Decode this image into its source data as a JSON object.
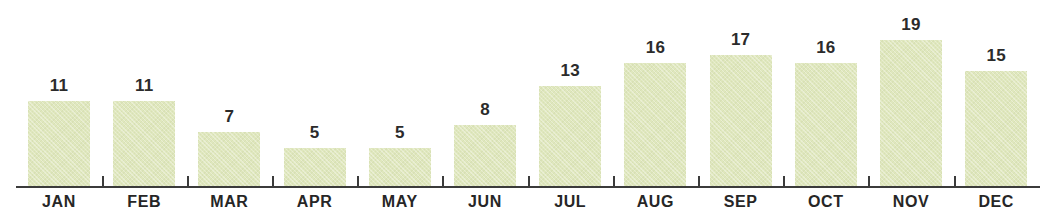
{
  "chart_data": {
    "type": "bar",
    "title": "",
    "subtitle": "",
    "xlabel": "",
    "ylabel": "",
    "categories": [
      "JAN",
      "FEB",
      "MAR",
      "APR",
      "MAY",
      "JUN",
      "JUL",
      "AUG",
      "SEP",
      "OCT",
      "NOV",
      "DEC"
    ],
    "values": [
      11,
      11,
      7,
      5,
      5,
      8,
      13,
      16,
      17,
      16,
      19,
      15
    ],
    "data_labels": [
      "11",
      "11",
      "7",
      "5",
      "5",
      "8",
      "13",
      "16",
      "17",
      "16",
      "19",
      "15"
    ],
    "ylim": [
      0,
      19
    ],
    "grid": false,
    "legend": null,
    "legend_position": "none",
    "bar_color": "#dfe7bd",
    "axis_color": "#3b3b3b",
    "label_color": "#262626",
    "value_label_color": "#2b2b2b",
    "background_color": "#ffffff",
    "annotations": []
  },
  "axis": {
    "baseline_name": "category-axis",
    "tick_count": 11
  }
}
